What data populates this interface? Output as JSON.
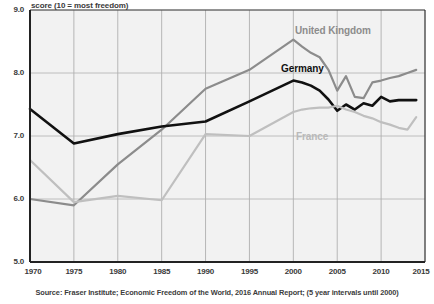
{
  "axis": {
    "y_caption": "score (10 = most freedom)",
    "y_ticks": [
      "9.0",
      "8.0",
      "7.0",
      "6.0",
      "5.0"
    ],
    "x_ticks": [
      "1970",
      "1975",
      "1980",
      "1985",
      "1990",
      "1995",
      "2000",
      "2005",
      "2010",
      "2015"
    ]
  },
  "source": "Source: Fraser Institute; Economic Freedom of the World, 2016 Annual Report; (5 year intervals until 2000)",
  "labels": {
    "uk": "United Kingdom",
    "germany": "Germany",
    "france": "France"
  },
  "colors": {
    "uk": "#8c8c8c",
    "germany": "#111111",
    "france": "#bfbfbf",
    "grid": "#b0b0b0",
    "axis": "#222222",
    "plot_bg": "#f2f2f2"
  },
  "chart_data": {
    "type": "line",
    "title": "",
    "xlabel": "",
    "ylabel": "score (10 = most freedom)",
    "ylim": [
      5.0,
      9.0
    ],
    "xlim": [
      1970,
      2015
    ],
    "grid": true,
    "legend": "inline-annotations",
    "x": [
      1970,
      1975,
      1980,
      1985,
      1990,
      1995,
      2000,
      2001,
      2002,
      2003,
      2004,
      2005,
      2006,
      2007,
      2008,
      2009,
      2010,
      2011,
      2012,
      2013,
      2014
    ],
    "series": [
      {
        "name": "United Kingdom",
        "color": "#8c8c8c",
        "values": [
          6.0,
          5.9,
          6.55,
          7.1,
          7.75,
          8.05,
          8.53,
          8.42,
          8.32,
          8.25,
          8.05,
          7.72,
          7.95,
          7.62,
          7.6,
          7.85,
          7.88,
          7.92,
          7.95,
          8.0,
          8.05
        ]
      },
      {
        "name": "Germany",
        "color": "#111111",
        "values": [
          7.43,
          6.88,
          7.03,
          7.15,
          7.23,
          7.55,
          7.88,
          7.85,
          7.8,
          7.72,
          7.58,
          7.4,
          7.5,
          7.42,
          7.52,
          7.48,
          7.62,
          7.55,
          7.57,
          7.57,
          7.57
        ]
      },
      {
        "name": "France",
        "color": "#bfbfbf",
        "values": [
          6.62,
          5.95,
          6.05,
          5.98,
          7.03,
          7.0,
          7.38,
          7.42,
          7.44,
          7.45,
          7.45,
          7.48,
          7.42,
          7.38,
          7.32,
          7.28,
          7.22,
          7.18,
          7.13,
          7.1,
          7.3
        ]
      }
    ]
  }
}
